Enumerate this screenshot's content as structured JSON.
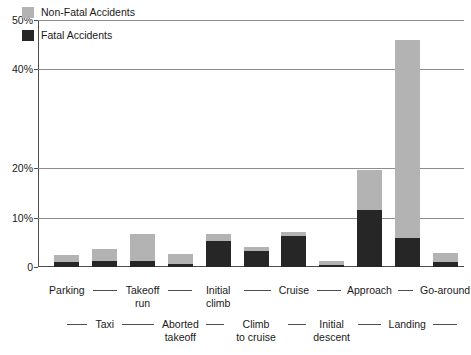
{
  "chart_data": {
    "type": "bar",
    "subtype": "stacked-vertical",
    "title": "",
    "xlabel": "",
    "ylabel": "",
    "ylim": [
      0,
      50
    ],
    "y_unit": "%",
    "grid": "horizontal",
    "legend_position": "top-left",
    "categories": [
      "Parking",
      "Taxi",
      "Takeoff\nrun",
      "Aborted\ntakeoff",
      "Initial\nclimb",
      "Climb\nto cruise",
      "Cruise",
      "Initial\ndescent",
      "Approach",
      "Landing",
      "Go-around"
    ],
    "series": [
      {
        "name": "Fatal Accidents",
        "color": "#262626",
        "values": [
          1.0,
          1.2,
          1.2,
          0.6,
          5.3,
          3.2,
          6.3,
          0.5,
          11.5,
          5.9,
          1.0
        ]
      },
      {
        "name": "Non-Fatal Accidents",
        "color": "#b3b3b3",
        "values": [
          1.4,
          2.5,
          5.5,
          2.1,
          1.4,
          0.8,
          0.8,
          0.7,
          8.2,
          40.1,
          1.8
        ]
      }
    ],
    "totals": [
      2.4,
      3.7,
      6.7,
      2.7,
      6.7,
      4.0,
      7.1,
      1.2,
      19.7,
      46.0,
      2.8
    ],
    "yticks": [
      {
        "value": 50,
        "label": "50%"
      },
      {
        "value": 40,
        "label": "40%"
      },
      {
        "value": 20,
        "label": "20%"
      },
      {
        "value": 10,
        "label": "10%"
      },
      {
        "value": 0,
        "label": "0"
      }
    ],
    "gridline_values": [
      50,
      40,
      20,
      10
    ],
    "legend": [
      {
        "label": "Non-Fatal Accidents",
        "color": "#b3b3b3"
      },
      {
        "label": "Fatal Accidents",
        "color": "#262626"
      }
    ],
    "xlabel_rows": {
      "top": [
        "Parking",
        "Takeoff\nrun",
        "Initial\nclimb",
        "Cruise",
        "Approach",
        "Go-around"
      ],
      "bottom": [
        "Taxi",
        "Aborted\ntakeoff",
        "Climb\nto cruise",
        "Initial\ndescent",
        "Landing"
      ]
    }
  },
  "colors": {
    "nonfatal": "#b3b3b3",
    "fatal": "#262626",
    "axis": "#4d4d4d",
    "grid": "#8c8c8c",
    "background": "#ffffff",
    "text": "#1a1a1a"
  }
}
